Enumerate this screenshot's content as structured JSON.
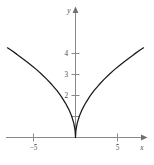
{
  "figure": {
    "top_caption": "",
    "background_color": "#ffffff",
    "axis_color": "#8a8a8a",
    "curve_color": "#1a1a1a",
    "label_color": "#4a4a4a"
  },
  "axes": {
    "x_axis_name": "x",
    "y_axis_name": "y",
    "x_tick_labels": [
      "−5",
      "5"
    ],
    "y_tick_labels": [
      "2",
      "3",
      "4"
    ]
  },
  "chart_data": {
    "type": "line",
    "title": "",
    "xlabel": "x",
    "ylabel": "y",
    "xlim": [
      -9,
      9.4
    ],
    "ylim": [
      -0.85,
      4.8
    ],
    "xticks": [
      -5,
      5
    ],
    "yticks": [
      1,
      2,
      3,
      4
    ],
    "xtick_labels": [
      "−5",
      "5"
    ],
    "ytick_labels": [
      "",
      "2",
      "3",
      "4"
    ],
    "grid": false,
    "legend": null,
    "series": [
      {
        "name": "y = 1.5·√|x|",
        "description": "even root-shaped curve with a sharp cusp at the origin, symmetric about the y-axis",
        "x": [
          -8.1,
          -7.6,
          -7.0,
          -6.4,
          -5.8,
          -5.2,
          -4.6,
          -4.0,
          -3.4,
          -2.8,
          -2.2,
          -1.7,
          -1.2,
          -0.8,
          -0.45,
          -0.2,
          -0.05,
          0,
          0.05,
          0.2,
          0.45,
          0.8,
          1.2,
          1.7,
          2.2,
          2.8,
          3.4,
          4.0,
          4.6,
          5.2,
          5.8,
          6.4,
          7.0,
          7.6,
          8.1
        ],
        "y": [
          4.27,
          4.14,
          3.97,
          3.79,
          3.61,
          3.42,
          3.22,
          3.0,
          2.77,
          2.51,
          2.23,
          1.96,
          1.64,
          1.34,
          1.01,
          0.67,
          0.34,
          0,
          0.34,
          0.67,
          1.01,
          1.34,
          1.64,
          1.96,
          2.23,
          2.51,
          2.77,
          3.0,
          3.22,
          3.42,
          3.61,
          3.79,
          3.97,
          4.14,
          4.27
        ]
      }
    ]
  }
}
